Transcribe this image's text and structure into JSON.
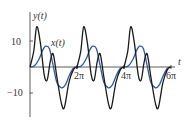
{
  "chart_data": {
    "type": "line",
    "title": "",
    "xlabel": "t",
    "ylabel": "",
    "xlim": [
      0,
      19.3
    ],
    "ylim": [
      -18,
      20
    ],
    "x_ticks": [
      "2π",
      "4π",
      "6π"
    ],
    "y_ticks": [
      "10",
      "−10"
    ],
    "grid": false,
    "series": [
      {
        "name": "y(t)",
        "color": "#1a1a1a",
        "t": [
          0,
          0.5,
          0.9,
          1.4,
          1.9,
          2.3,
          2.7,
          3.1,
          3.6,
          4.2,
          4.6,
          5.2,
          5.8,
          6.283
        ],
        "values": [
          0,
          6,
          15.5,
          9,
          -3,
          -5,
          2,
          5,
          -4,
          -14,
          -15.5,
          -6,
          -1,
          0
        ]
      },
      {
        "name": "x(t)",
        "color": "#2a5aa8",
        "t": [
          0,
          0.6,
          1.2,
          1.7,
          2.1,
          2.6,
          3.1,
          3.6,
          4.2,
          4.7,
          5.3,
          5.8,
          6.283
        ],
        "values": [
          0,
          0.5,
          3,
          6.5,
          8,
          7,
          0.5,
          -6,
          -8,
          -7,
          -3,
          -0.5,
          0
        ]
      }
    ],
    "labels": {
      "y_curve": "y(t)",
      "x_curve": "x(t)"
    }
  }
}
